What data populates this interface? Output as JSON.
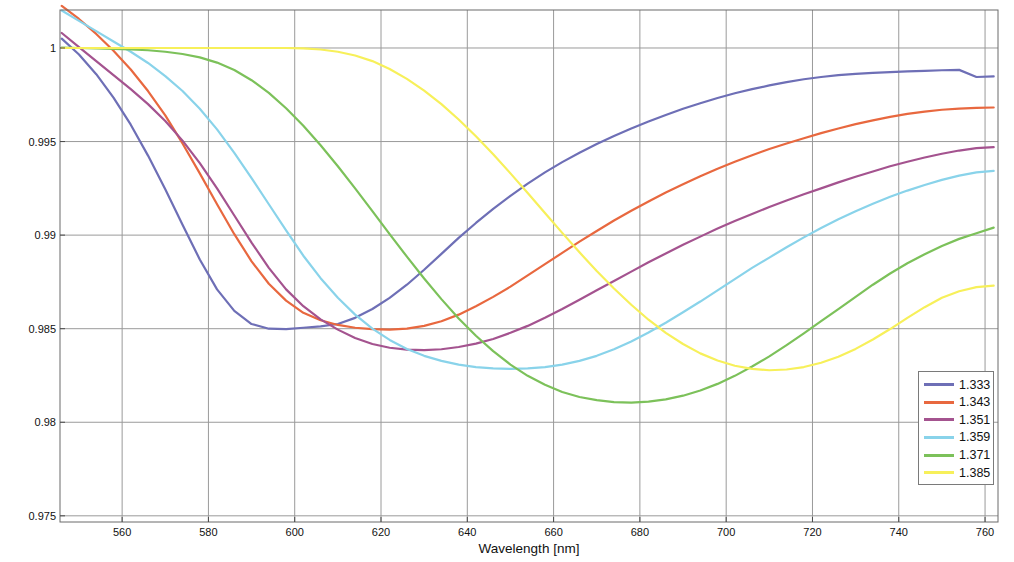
{
  "chart_data": {
    "type": "line",
    "title": "",
    "xlabel": "Wavelength [nm]",
    "ylabel": "Normalized Transmitted Light Intensity",
    "xlim": [
      545.6,
      763.0
    ],
    "ylim": [
      0.97467,
      1.00203
    ],
    "xticks": [
      560,
      580,
      600,
      620,
      640,
      660,
      680,
      700,
      720,
      740,
      760
    ],
    "yticks": [
      0.975,
      0.98,
      0.985,
      0.99,
      0.995,
      1
    ],
    "ytick_labels": [
      "0.975",
      "0.98",
      "0.985",
      "0.99",
      "0.995",
      "1"
    ],
    "xtick_labels": [
      "560",
      "580",
      "600",
      "620",
      "640",
      "660",
      "680",
      "700",
      "720",
      "740",
      "760"
    ],
    "grid": true,
    "legend_position": "lower right",
    "legend_title": "",
    "x": [
      546,
      550,
      554,
      558,
      562,
      566,
      570,
      574,
      578,
      582,
      586,
      590,
      594,
      598,
      602,
      606,
      610,
      614,
      618,
      622,
      626,
      630,
      634,
      638,
      642,
      646,
      650,
      654,
      658,
      662,
      666,
      670,
      674,
      678,
      682,
      686,
      690,
      694,
      698,
      702,
      706,
      710,
      714,
      718,
      722,
      726,
      730,
      734,
      738,
      742,
      746,
      750,
      754,
      758,
      762
    ],
    "series": [
      {
        "name": "1.333",
        "color": "#6e6fb6",
        "values": [
          1.0005,
          0.99965,
          0.9986,
          0.99735,
          0.9959,
          0.99425,
          0.99245,
          0.99055,
          0.9887,
          0.9871,
          0.98595,
          0.98525,
          0.985,
          0.98498,
          0.98505,
          0.98512,
          0.98525,
          0.98558,
          0.98605,
          0.98665,
          0.98735,
          0.98815,
          0.989,
          0.98985,
          0.99065,
          0.9914,
          0.9921,
          0.99275,
          0.99335,
          0.9939,
          0.9944,
          0.99487,
          0.9953,
          0.9957,
          0.99607,
          0.99642,
          0.99675,
          0.99705,
          0.99733,
          0.99758,
          0.9978,
          0.998,
          0.99818,
          0.99833,
          0.99845,
          0.99855,
          0.99862,
          0.99867,
          0.99871,
          0.99875,
          0.99878,
          0.99881,
          0.99883,
          0.99845,
          0.99848
        ]
      },
      {
        "name": "1.343",
        "color": "#e8683f",
        "values": [
          1.00225,
          1.00155,
          1.00075,
          0.99985,
          0.99885,
          0.9977,
          0.9964,
          0.9949,
          0.9933,
          0.99165,
          0.99005,
          0.9886,
          0.9874,
          0.9865,
          0.98585,
          0.98545,
          0.9852,
          0.98505,
          0.98498,
          0.98495,
          0.985,
          0.98515,
          0.9854,
          0.98575,
          0.9862,
          0.9867,
          0.98725,
          0.98785,
          0.98845,
          0.98905,
          0.98965,
          0.99022,
          0.99078,
          0.9913,
          0.9918,
          0.99228,
          0.99272,
          0.99315,
          0.99355,
          0.99392,
          0.99427,
          0.9946,
          0.9949,
          0.99518,
          0.99545,
          0.9957,
          0.99593,
          0.99613,
          0.99632,
          0.99648,
          0.9966,
          0.9967,
          0.99676,
          0.9968,
          0.99682
        ]
      },
      {
        "name": "1.351",
        "color": "#a4538f",
        "values": [
          1.0008,
          1.00005,
          0.9993,
          0.99855,
          0.9978,
          0.997,
          0.9961,
          0.99505,
          0.99385,
          0.9925,
          0.99105,
          0.9896,
          0.98825,
          0.9871,
          0.9862,
          0.9855,
          0.98495,
          0.9845,
          0.98418,
          0.98398,
          0.98388,
          0.98385,
          0.9839,
          0.98402,
          0.9842,
          0.98445,
          0.98478,
          0.98515,
          0.98558,
          0.98605,
          0.98655,
          0.98705,
          0.98755,
          0.98805,
          0.98855,
          0.98902,
          0.98948,
          0.98992,
          0.99035,
          0.99075,
          0.99113,
          0.9915,
          0.99185,
          0.99218,
          0.9925,
          0.99282,
          0.99312,
          0.9934,
          0.99368,
          0.99392,
          0.99415,
          0.99435,
          0.99452,
          0.99465,
          0.9947
        ]
      },
      {
        "name": "1.359",
        "color": "#89d3ea",
        "values": [
          1.002,
          1.00145,
          1.0009,
          1.00035,
          0.9998,
          0.9992,
          0.9985,
          0.9977,
          0.99675,
          0.99565,
          0.9944,
          0.99305,
          0.99165,
          0.99025,
          0.9889,
          0.9877,
          0.98665,
          0.98575,
          0.985,
          0.9844,
          0.98392,
          0.98355,
          0.98328,
          0.98308,
          0.98295,
          0.98288,
          0.98285,
          0.98288,
          0.98295,
          0.98308,
          0.98328,
          0.98355,
          0.9839,
          0.98432,
          0.9848,
          0.98532,
          0.98588,
          0.98645,
          0.98705,
          0.98765,
          0.98825,
          0.9888,
          0.98935,
          0.98988,
          0.99038,
          0.99085,
          0.99128,
          0.99168,
          0.99205,
          0.99238,
          0.99268,
          0.99295,
          0.99318,
          0.99335,
          0.99343
        ]
      },
      {
        "name": "1.371",
        "color": "#7cc15a",
        "values": [
          1.00002,
          1.0,
          0.99998,
          0.99995,
          0.99992,
          0.99988,
          0.9998,
          0.99968,
          0.9995,
          0.99922,
          0.99882,
          0.99828,
          0.9976,
          0.99678,
          0.99585,
          0.9948,
          0.99368,
          0.9925,
          0.99128,
          0.99005,
          0.98885,
          0.98768,
          0.98658,
          0.98555,
          0.98462,
          0.9838,
          0.98308,
          0.98248,
          0.982,
          0.98162,
          0.98135,
          0.98118,
          0.98108,
          0.98105,
          0.9811,
          0.98122,
          0.98142,
          0.9817,
          0.98205,
          0.98248,
          0.98298,
          0.98352,
          0.98412,
          0.98475,
          0.9854,
          0.98605,
          0.9867,
          0.98735,
          0.98795,
          0.9885,
          0.98898,
          0.98942,
          0.9898,
          0.9901,
          0.9904
        ]
      },
      {
        "name": "1.385",
        "color": "#f7f05a",
        "values": [
          1.0,
          1.0,
          1.0,
          1.0,
          1.0,
          1.0,
          1.0,
          1.0,
          1.0,
          1.0,
          1.0,
          1.0,
          1.0,
          1.0,
          0.99998,
          0.99992,
          0.9998,
          0.9996,
          0.9993,
          0.99888,
          0.99835,
          0.99772,
          0.997,
          0.99618,
          0.99528,
          0.99432,
          0.9933,
          0.99225,
          0.99118,
          0.99012,
          0.98908,
          0.98808,
          0.98715,
          0.98628,
          0.98548,
          0.98478,
          0.98418,
          0.98368,
          0.9833,
          0.98302,
          0.98285,
          0.98278,
          0.98282,
          0.98295,
          0.98318,
          0.9835,
          0.98392,
          0.98442,
          0.98498,
          0.98558,
          0.98615,
          0.98665,
          0.987,
          0.98722,
          0.9873
        ]
      }
    ]
  },
  "legend": {
    "entries": [
      {
        "label": "1.333",
        "color": "#6e6fb6"
      },
      {
        "label": "1.343",
        "color": "#e8683f"
      },
      {
        "label": "1.351",
        "color": "#a4538f"
      },
      {
        "label": "1.359",
        "color": "#89d3ea"
      },
      {
        "label": "1.371",
        "color": "#7cc15a"
      },
      {
        "label": "1.385",
        "color": "#f7f05a"
      }
    ]
  },
  "axes": {
    "frame_color": "#6a6a6a",
    "grid_color": "#9a9a9a",
    "background": "#ffffff"
  }
}
